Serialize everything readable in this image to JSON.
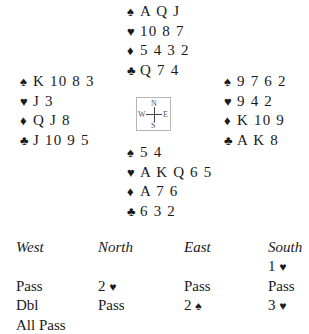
{
  "suits": {
    "spades": "♠",
    "hearts": "♥",
    "diamonds": "♦",
    "clubs": "♣"
  },
  "hands": {
    "north": {
      "spades": "A Q J",
      "hearts": "10 8 7",
      "diamonds": "5 4 3 2",
      "clubs": "Q 7 4"
    },
    "west": {
      "spades": "K 10 8 3",
      "hearts": "J 3",
      "diamonds": "Q J 8",
      "clubs": "J 10 9 5"
    },
    "east": {
      "spades": "9 7 6 2",
      "hearts": "9 4 2",
      "diamonds": "K 10 9",
      "clubs": "A K 8"
    },
    "south": {
      "spades": "5 4",
      "hearts": "A K Q 6 5",
      "diamonds": "A 7 6",
      "clubs": "6 3 2"
    }
  },
  "compass": {
    "n": "N",
    "s": "S",
    "w": "W",
    "e": "E"
  },
  "auction": {
    "headers": {
      "west": "West",
      "north": "North",
      "east": "East",
      "south": "South"
    },
    "west": [
      "",
      "Pass",
      "Dbl",
      "All Pass"
    ],
    "north": [
      "",
      "2",
      "Pass",
      ""
    ],
    "north_suits": [
      "",
      "♥",
      "",
      ""
    ],
    "east": [
      "",
      "Pass",
      "2",
      ""
    ],
    "east_suits": [
      "",
      "",
      "♠",
      ""
    ],
    "south": [
      "1",
      "Pass",
      "3",
      ""
    ],
    "south_suits": [
      "♥",
      "",
      "♥",
      ""
    ]
  }
}
